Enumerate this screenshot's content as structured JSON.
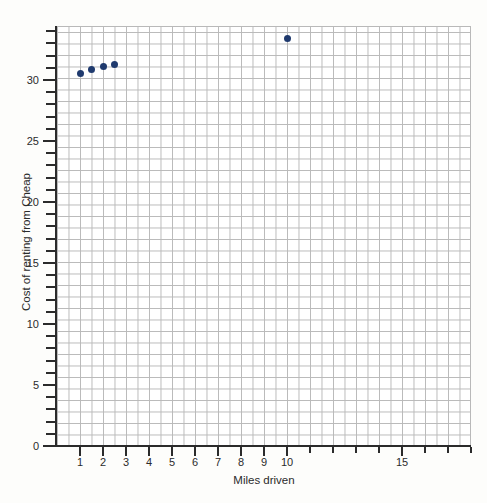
{
  "chart_data": {
    "type": "scatter",
    "title": "",
    "xlabel": "Miles driven",
    "ylabel": "Cost of renting from Cheap",
    "xlim": [
      0,
      18
    ],
    "ylim": [
      0,
      34.5
    ],
    "grid": true,
    "legend": false,
    "point_color": "#1f3a6e",
    "grid_color": "#b9b9b9",
    "axis_color": "#2b2b2b",
    "background": "#fdfdfb",
    "x_ticks": [
      {
        "value": 1,
        "label": "1"
      },
      {
        "value": 2,
        "label": "2"
      },
      {
        "value": 3,
        "label": "3"
      },
      {
        "value": 4,
        "label": "4"
      },
      {
        "value": 5,
        "label": "5"
      },
      {
        "value": 6,
        "label": "6"
      },
      {
        "value": 7,
        "label": "7"
      },
      {
        "value": 8,
        "label": "8"
      },
      {
        "value": 9,
        "label": "9"
      },
      {
        "value": 10,
        "label": "10"
      },
      {
        "value": 11,
        "label": ""
      },
      {
        "value": 12,
        "label": ""
      },
      {
        "value": 13,
        "label": ""
      },
      {
        "value": 14,
        "label": ""
      },
      {
        "value": 15,
        "label": "15"
      },
      {
        "value": 16,
        "label": ""
      },
      {
        "value": 17,
        "label": ""
      },
      {
        "value": 18,
        "label": ""
      }
    ],
    "y_ticks": [
      {
        "value": 0,
        "label": "0"
      },
      {
        "value": 1,
        "label": ""
      },
      {
        "value": 2,
        "label": ""
      },
      {
        "value": 3,
        "label": ""
      },
      {
        "value": 4,
        "label": ""
      },
      {
        "value": 5,
        "label": "5"
      },
      {
        "value": 6,
        "label": ""
      },
      {
        "value": 7,
        "label": ""
      },
      {
        "value": 8,
        "label": ""
      },
      {
        "value": 9,
        "label": ""
      },
      {
        "value": 10,
        "label": "10"
      },
      {
        "value": 11,
        "label": ""
      },
      {
        "value": 12,
        "label": ""
      },
      {
        "value": 13,
        "label": ""
      },
      {
        "value": 14,
        "label": ""
      },
      {
        "value": 15,
        "label": "15"
      },
      {
        "value": 16,
        "label": ""
      },
      {
        "value": 17,
        "label": ""
      },
      {
        "value": 18,
        "label": ""
      },
      {
        "value": 19,
        "label": ""
      },
      {
        "value": 20,
        "label": "20"
      },
      {
        "value": 21,
        "label": ""
      },
      {
        "value": 22,
        "label": ""
      },
      {
        "value": 23,
        "label": ""
      },
      {
        "value": 24,
        "label": ""
      },
      {
        "value": 25,
        "label": "25"
      },
      {
        "value": 26,
        "label": ""
      },
      {
        "value": 27,
        "label": ""
      },
      {
        "value": 28,
        "label": ""
      },
      {
        "value": 29,
        "label": ""
      },
      {
        "value": 30,
        "label": "30"
      },
      {
        "value": 31,
        "label": ""
      },
      {
        "value": 32,
        "label": ""
      },
      {
        "value": 33,
        "label": ""
      },
      {
        "value": 34,
        "label": ""
      }
    ],
    "points": [
      {
        "x": 1.0,
        "y": 30.5
      },
      {
        "x": 1.5,
        "y": 30.9
      },
      {
        "x": 2.0,
        "y": 31.1
      },
      {
        "x": 2.5,
        "y": 31.3
      },
      {
        "x": 10.0,
        "y": 33.4
      }
    ]
  }
}
